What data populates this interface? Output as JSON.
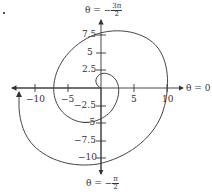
{
  "figure": {
    "type": "polar-spiral-plot",
    "axis_labels": {
      "right": "θ = 0",
      "top": {
        "prefix": "θ = −",
        "num": "3π",
        "den": "2"
      },
      "bottom": {
        "prefix": "θ = −",
        "num": "π",
        "den": "2"
      }
    },
    "x_ticks": [
      {
        "value": -10,
        "label": "−10"
      },
      {
        "value": -5,
        "label": "−5"
      },
      {
        "value": 5,
        "label": "5"
      },
      {
        "value": 10,
        "label": "10"
      }
    ],
    "y_ticks": [
      {
        "value": 7.5,
        "label": "7.5"
      },
      {
        "value": 5,
        "label": "5"
      },
      {
        "value": 2.5,
        "label": "2.5"
      },
      {
        "value": -2.5,
        "label": "−2.5"
      },
      {
        "value": -5,
        "label": "−5"
      },
      {
        "value": -7.5,
        "label": "−7.5"
      },
      {
        "value": -10,
        "label": "−10"
      }
    ],
    "curve": "spiral r = −θ (clockwise, with arrowhead at end)",
    "colors": {
      "curve": "#444444",
      "axes": "#333333",
      "text": "#333333"
    }
  }
}
